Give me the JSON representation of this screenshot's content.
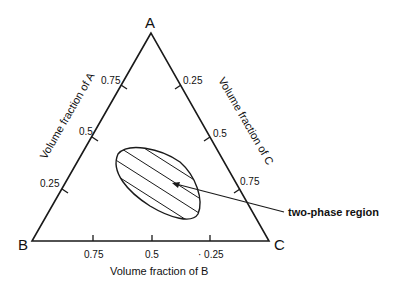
{
  "vertices": {
    "A": "A",
    "B": "B",
    "C": "C"
  },
  "axes": {
    "left": {
      "label": "Volume fraction of A",
      "ticks": [
        "0.75",
        "0.5",
        "0.25"
      ]
    },
    "right": {
      "label": "Volume fraction of C",
      "ticks": [
        "0.25",
        "0.5",
        "0.75"
      ]
    },
    "bottom": {
      "label": "Volume fraction of B",
      "ticks": [
        "0.75",
        "0.5",
        "· 0.25"
      ]
    }
  },
  "annotation": {
    "label": "two-phase region"
  },
  "colors": {
    "line": "#1a1a1a",
    "text": "#111111",
    "background": "#ffffff"
  }
}
